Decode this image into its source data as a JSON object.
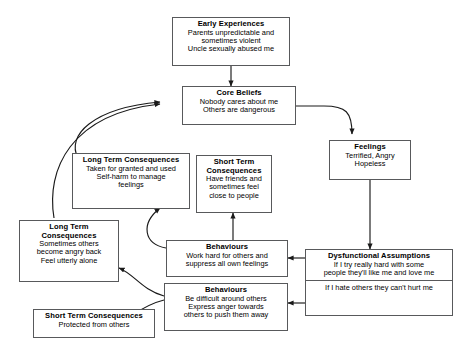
{
  "diagram": {
    "type": "flowchart",
    "line_color": "#58595b",
    "text_color": "#000000",
    "background": "#ffffff",
    "nodes": [
      {
        "id": "early-experiences",
        "title": "Early Experiences",
        "lines": [
          "Parents unpredictable and",
          "sometimes violent",
          "Uncle sexually abused me"
        ]
      },
      {
        "id": "core-beliefs",
        "title": "Core Beliefs",
        "lines": [
          "Nobody cares about me",
          "Others are dangerous"
        ]
      },
      {
        "id": "feelings",
        "title": "Feelings",
        "lines": [
          "Terrified, Angry",
          "Hopeless"
        ]
      },
      {
        "id": "long-term-consequences-upper",
        "title": "Long Term Consequences",
        "lines": [
          "Taken for granted and used",
          "Self-harm to manage",
          "feelings"
        ]
      },
      {
        "id": "short-term-consequences-upper",
        "title": "Short Term",
        "title2": "Consequences",
        "lines": [
          "Have friends and",
          "sometimes feel",
          "close to people"
        ]
      },
      {
        "id": "long-term-consequences-lower",
        "title": "Long Term",
        "title2": "Consequences",
        "lines": [
          "Sometimes others",
          "become angry back",
          "Feel utterly alone"
        ]
      },
      {
        "id": "behaviours-upper",
        "title": "Behaviours",
        "lines": [
          "Work hard for others and",
          "suppress all own feelings"
        ]
      },
      {
        "id": "dysfunctional-assumptions",
        "title": "Dysfunctional Assumptions",
        "lines": [
          "If I try really hard with some",
          "people they'll like me and love me"
        ],
        "lines2": [
          "If I hate others they can't hurt me"
        ]
      },
      {
        "id": "behaviours-lower",
        "title": "Behaviours",
        "lines": [
          "Be difficult around others",
          "Express anger towards",
          "others to push them away"
        ]
      },
      {
        "id": "short-term-consequences-lower",
        "title": "Short Term Consequences",
        "lines": [
          "Protected from others"
        ]
      }
    ],
    "edges": [
      {
        "from": "early-experiences",
        "to": "core-beliefs"
      },
      {
        "from": "core-beliefs",
        "to": "feelings"
      },
      {
        "from": "feelings",
        "to": "dysfunctional-assumptions"
      },
      {
        "from": "dysfunctional-assumptions",
        "to": "behaviours-upper"
      },
      {
        "from": "dysfunctional-assumptions",
        "to": "behaviours-lower"
      },
      {
        "from": "behaviours-upper",
        "to": "short-term-consequences-upper"
      },
      {
        "from": "behaviours-upper",
        "to": "long-term-consequences-upper"
      },
      {
        "from": "behaviours-lower",
        "to": "long-term-consequences-lower"
      },
      {
        "from": "behaviours-lower",
        "to": "short-term-consequences-lower"
      },
      {
        "from": "long-term-consequences-upper",
        "to": "core-beliefs"
      },
      {
        "from": "long-term-consequences-lower",
        "to": "core-beliefs"
      }
    ]
  }
}
